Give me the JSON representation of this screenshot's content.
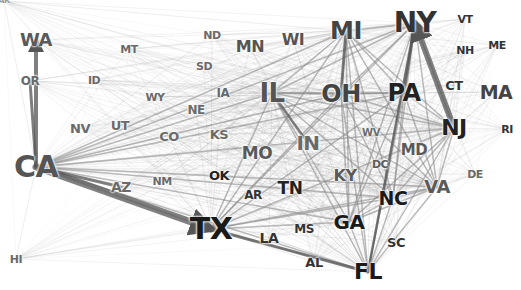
{
  "diagram": {
    "type": "state-flow-network",
    "background": "#ffffff",
    "edge_color": "#8a8a8a",
    "strong_edge_color": "#555555"
  },
  "nodes": [
    {
      "id": "AK",
      "label": "AK",
      "x": 4,
      "y": 1,
      "size": 8,
      "color": "#9a9a9a"
    },
    {
      "id": "WA",
      "label": "WA",
      "x": 36,
      "y": 40,
      "size": 18,
      "color": "#5a5a5a"
    },
    {
      "id": "OR",
      "label": "OR",
      "x": 30,
      "y": 81,
      "size": 12,
      "color": "#6a6a6a"
    },
    {
      "id": "MT",
      "label": "MT",
      "x": 129,
      "y": 49,
      "size": 11,
      "color": "#6a6a6a"
    },
    {
      "id": "ID",
      "label": "ID",
      "x": 94,
      "y": 80,
      "size": 11,
      "color": "#6a6a6a"
    },
    {
      "id": "ND",
      "label": "ND",
      "x": 212,
      "y": 35,
      "size": 11,
      "color": "#6a6a6a"
    },
    {
      "id": "SD",
      "label": "SD",
      "x": 204,
      "y": 66,
      "size": 11,
      "color": "#6a6a6a"
    },
    {
      "id": "MN",
      "label": "MN",
      "x": 250,
      "y": 47,
      "size": 16,
      "color": "#555555"
    },
    {
      "id": "WY",
      "label": "WY",
      "x": 155,
      "y": 97,
      "size": 11,
      "color": "#6a6a6a"
    },
    {
      "id": "IA",
      "label": "IA",
      "x": 223,
      "y": 93,
      "size": 12,
      "color": "#6a6a6a"
    },
    {
      "id": "NE",
      "label": "NE",
      "x": 196,
      "y": 110,
      "size": 12,
      "color": "#6a6a6a"
    },
    {
      "id": "NV",
      "label": "NV",
      "x": 80,
      "y": 128,
      "size": 13,
      "color": "#6a6a6a"
    },
    {
      "id": "UT",
      "label": "UT",
      "x": 120,
      "y": 125,
      "size": 13,
      "color": "#6a6a6a"
    },
    {
      "id": "CO",
      "label": "CO",
      "x": 169,
      "y": 136,
      "size": 13,
      "color": "#6a6a6a"
    },
    {
      "id": "KS",
      "label": "KS",
      "x": 219,
      "y": 134,
      "size": 13,
      "color": "#6a6a6a"
    },
    {
      "id": "CA",
      "label": "CA",
      "x": 36,
      "y": 167,
      "size": 30,
      "color": "#555555"
    },
    {
      "id": "AZ",
      "label": "AZ",
      "x": 121,
      "y": 187,
      "size": 14,
      "color": "#6a6a6a"
    },
    {
      "id": "NM",
      "label": "NM",
      "x": 162,
      "y": 181,
      "size": 11,
      "color": "#6a6a6a"
    },
    {
      "id": "OK",
      "label": "OK",
      "x": 219,
      "y": 175,
      "size": 13,
      "color": "#222222"
    },
    {
      "id": "AR",
      "label": "AR",
      "x": 253,
      "y": 195,
      "size": 12,
      "color": "#333333"
    },
    {
      "id": "TX",
      "label": "TX",
      "x": 211,
      "y": 229,
      "size": 30,
      "color": "#1a1a1a"
    },
    {
      "id": "LA",
      "label": "LA",
      "x": 269,
      "y": 238,
      "size": 14,
      "color": "#333333"
    },
    {
      "id": "MS",
      "label": "MS",
      "x": 304,
      "y": 229,
      "size": 12,
      "color": "#333333"
    },
    {
      "id": "AL",
      "label": "AL",
      "x": 314,
      "y": 262,
      "size": 13,
      "color": "#333333"
    },
    {
      "id": "MO",
      "label": "MO",
      "x": 257,
      "y": 153,
      "size": 17,
      "color": "#5a5a5a"
    },
    {
      "id": "IN",
      "label": "IN",
      "x": 308,
      "y": 143,
      "size": 20,
      "color": "#6a6a6a"
    },
    {
      "id": "TN",
      "label": "TN",
      "x": 290,
      "y": 188,
      "size": 17,
      "color": "#222222"
    },
    {
      "id": "KY",
      "label": "KY",
      "x": 345,
      "y": 176,
      "size": 16,
      "color": "#5a5a5a"
    },
    {
      "id": "GA",
      "label": "GA",
      "x": 349,
      "y": 222,
      "size": 20,
      "color": "#1a1a1a"
    },
    {
      "id": "FL",
      "label": "FL",
      "x": 368,
      "y": 272,
      "size": 22,
      "color": "#1a1a1a"
    },
    {
      "id": "SC",
      "label": "SC",
      "x": 396,
      "y": 242,
      "size": 13,
      "color": "#333333"
    },
    {
      "id": "NC",
      "label": "NC",
      "x": 393,
      "y": 198,
      "size": 19,
      "color": "#1a1a1a"
    },
    {
      "id": "VA",
      "label": "VA",
      "x": 437,
      "y": 187,
      "size": 18,
      "color": "#5a5a5a"
    },
    {
      "id": "DE",
      "label": "DE",
      "x": 475,
      "y": 174,
      "size": 11,
      "color": "#6a6a6a"
    },
    {
      "id": "DC",
      "label": "DC",
      "x": 380,
      "y": 164,
      "size": 11,
      "color": "#5a5a5a"
    },
    {
      "id": "MD",
      "label": "MD",
      "x": 414,
      "y": 150,
      "size": 15,
      "color": "#5a5a5a"
    },
    {
      "id": "WV",
      "label": "WV",
      "x": 371,
      "y": 133,
      "size": 10,
      "color": "#6a6a6a"
    },
    {
      "id": "WI",
      "label": "WI",
      "x": 293,
      "y": 40,
      "size": 16,
      "color": "#555555"
    },
    {
      "id": "MI",
      "label": "MI",
      "x": 346,
      "y": 31,
      "size": 24,
      "color": "#444444"
    },
    {
      "id": "IL",
      "label": "IL",
      "x": 272,
      "y": 93,
      "size": 26,
      "color": "#555555"
    },
    {
      "id": "OH",
      "label": "OH",
      "x": 341,
      "y": 94,
      "size": 24,
      "color": "#444444"
    },
    {
      "id": "PA",
      "label": "PA",
      "x": 404,
      "y": 93,
      "size": 24,
      "color": "#222222"
    },
    {
      "id": "NY",
      "label": "NY",
      "x": 415,
      "y": 23,
      "size": 28,
      "color": "#333333"
    },
    {
      "id": "VT",
      "label": "VT",
      "x": 465,
      "y": 19,
      "size": 11,
      "color": "#333333"
    },
    {
      "id": "NH",
      "label": "NH",
      "x": 465,
      "y": 50,
      "size": 11,
      "color": "#333333"
    },
    {
      "id": "ME",
      "label": "ME",
      "x": 497,
      "y": 45,
      "size": 11,
      "color": "#333333"
    },
    {
      "id": "CT",
      "label": "CT",
      "x": 454,
      "y": 85,
      "size": 13,
      "color": "#333333"
    },
    {
      "id": "MA",
      "label": "MA",
      "x": 496,
      "y": 92,
      "size": 19,
      "color": "#444444"
    },
    {
      "id": "NJ",
      "label": "NJ",
      "x": 454,
      "y": 128,
      "size": 22,
      "color": "#222222"
    },
    {
      "id": "RI",
      "label": "RI",
      "x": 507,
      "y": 129,
      "size": 11,
      "color": "#333333"
    },
    {
      "id": "HI",
      "label": "HI",
      "x": 16,
      "y": 259,
      "size": 11,
      "color": "#6a6a6a"
    }
  ],
  "strong_edges": [
    {
      "from": "CA",
      "to": "TX",
      "width": 7,
      "arrow": true
    },
    {
      "from": "NJ",
      "to": "NY",
      "width": 6,
      "arrow": true
    },
    {
      "from": "CA",
      "to": "WA",
      "width": 4,
      "arrow": true
    },
    {
      "from": "CA",
      "to": "OR",
      "width": 3,
      "arrow": false
    },
    {
      "from": "TX",
      "to": "FL",
      "width": 3,
      "arrow": false
    },
    {
      "from": "MI",
      "to": "OH",
      "width": 3,
      "arrow": false
    },
    {
      "from": "CA",
      "to": "AZ",
      "width": 3,
      "arrow": false
    },
    {
      "from": "NY",
      "to": "FL",
      "width": 2.5,
      "arrow": false
    },
    {
      "from": "IL",
      "to": "IN",
      "width": 2.5,
      "arrow": false
    },
    {
      "from": "NY",
      "to": "PA",
      "width": 2.5,
      "arrow": false
    }
  ],
  "hub_nodes": [
    "CA",
    "TX",
    "NY",
    "FL",
    "IL",
    "NJ",
    "PA",
    "OH",
    "MI",
    "GA",
    "NC",
    "VA"
  ]
}
